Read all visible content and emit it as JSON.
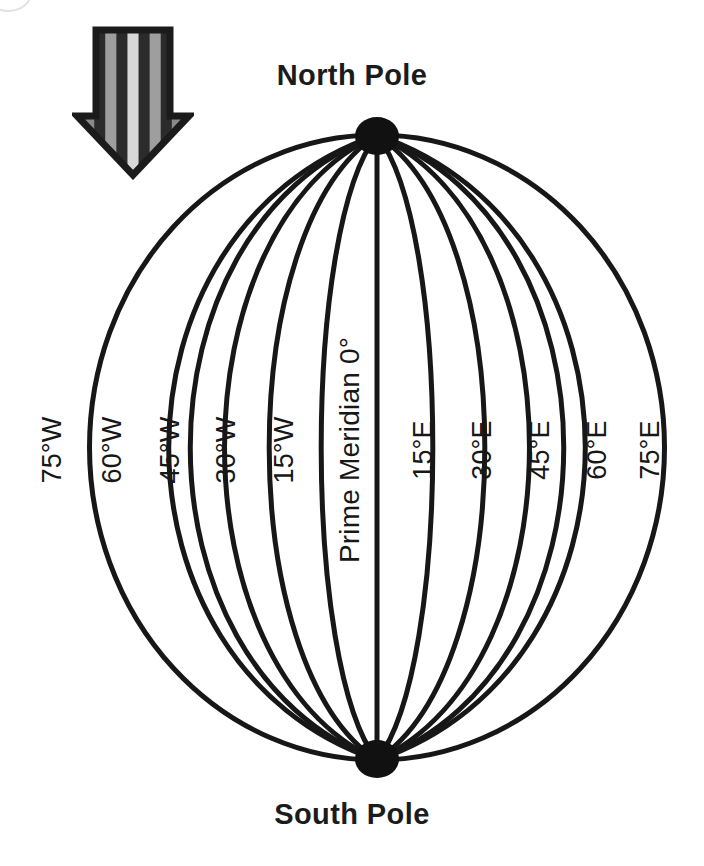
{
  "figure": {
    "title_north": "North Pole",
    "title_south": "South Pole",
    "ink_color": "#171717",
    "background_color": "#ffffff"
  },
  "arrow": {
    "name": "striped-down-arrow",
    "direction": "down",
    "stripe_colors": [
      "#2b2b2b",
      "#8a8a8a",
      "#2b2b2b",
      "#9e9e9e",
      "#2b2b2b",
      "#d8d8d8",
      "#2b2b2b",
      "#9e9e9e",
      "#2b2b2b",
      "#8a8a8a",
      "#2b2b2b"
    ],
    "outline_color": "#1b1b1b"
  },
  "globe": {
    "center_x": 377,
    "top_y": 135,
    "bottom_y": 760,
    "left_x": 90,
    "right_x": 665,
    "line_color": "#171717",
    "pole_marker_color": "#111111"
  },
  "meridians": [
    {
      "label": "75°W",
      "longitude": -75,
      "x": 52,
      "y": 450
    },
    {
      "label": "60°W",
      "longitude": -60,
      "x": 112,
      "y": 450
    },
    {
      "label": "45°W",
      "longitude": -45,
      "x": 170,
      "y": 450
    },
    {
      "label": "30°W",
      "longitude": -30,
      "x": 226,
      "y": 450
    },
    {
      "label": "15°W",
      "longitude": -15,
      "x": 284,
      "y": 450
    },
    {
      "label": "Prime Meridian 0°",
      "longitude": 0,
      "x": 350,
      "y": 450
    },
    {
      "label": "15°E",
      "longitude": 15,
      "x": 423,
      "y": 450
    },
    {
      "label": "30°E",
      "longitude": 30,
      "x": 482,
      "y": 450
    },
    {
      "label": "45°E",
      "longitude": 45,
      "x": 540,
      "y": 450
    },
    {
      "label": "60°E",
      "longitude": 60,
      "x": 597,
      "y": 450
    },
    {
      "label": "75°E",
      "longitude": 75,
      "x": 650,
      "y": 450
    }
  ],
  "chart_data": {
    "type": "diagram",
    "title": "",
    "annotations": [
      "North Pole",
      "South Pole"
    ],
    "meridian_labels": [
      "75°W",
      "60°W",
      "45°W",
      "30°W",
      "15°W",
      "Prime Meridian 0°",
      "15°E",
      "30°E",
      "45°E",
      "60°E",
      "75°E"
    ],
    "longitudes": [
      -75,
      -60,
      -45,
      -30,
      -15,
      0,
      15,
      30,
      45,
      60,
      75
    ]
  }
}
